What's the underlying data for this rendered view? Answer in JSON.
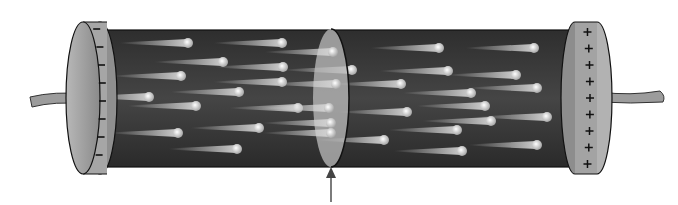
{
  "figure": {
    "left_cap": {
      "sign": "-",
      "marks": 8
    },
    "right_cap": {
      "sign": "+",
      "marks": 9
    },
    "colors": {
      "body": "#3a3a3a",
      "cap": "#9a9a9a",
      "electron": "#d8d8d8",
      "cross_section": "#b5b5b5",
      "arrow": "#444444"
    },
    "electrons": [
      [
        188,
        43
      ],
      [
        282,
        43
      ],
      [
        223,
        62
      ],
      [
        283,
        67
      ],
      [
        181,
        76
      ],
      [
        282,
        82
      ],
      [
        239,
        92
      ],
      [
        149,
        97
      ],
      [
        196,
        106
      ],
      [
        298,
        108
      ],
      [
        259,
        128
      ],
      [
        178,
        133
      ],
      [
        237,
        149
      ],
      [
        333,
        52
      ],
      [
        352,
        70
      ],
      [
        336,
        84
      ],
      [
        329,
        108
      ],
      [
        331,
        123
      ],
      [
        331,
        133
      ],
      [
        439,
        48
      ],
      [
        534,
        48
      ],
      [
        448,
        71
      ],
      [
        516,
        75
      ],
      [
        401,
        84
      ],
      [
        471,
        93
      ],
      [
        537,
        88
      ],
      [
        485,
        106
      ],
      [
        407,
        112
      ],
      [
        547,
        117
      ],
      [
        491,
        121
      ],
      [
        457,
        130
      ],
      [
        384,
        140
      ],
      [
        537,
        145
      ],
      [
        462,
        151
      ]
    ]
  }
}
